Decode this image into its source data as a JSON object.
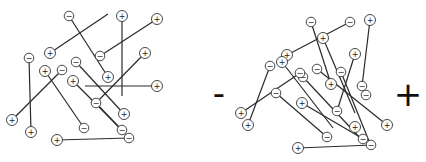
{
  "diagram": {
    "labels": {
      "negative_terminal": "-",
      "positive_terminal": "+"
    },
    "node_glyphs": {
      "positive": "+",
      "negative": "−"
    },
    "left_panel": {
      "edges": [
        {
          "from": [
            69,
            16
          ],
          "to": [
            108,
            77
          ]
        },
        {
          "from": [
            50,
            53
          ],
          "to": [
            108,
            14
          ]
        },
        {
          "from": [
            122,
            16
          ],
          "to": [
            122,
            96
          ]
        },
        {
          "from": [
            157,
            19
          ],
          "to": [
            100,
            56
          ]
        },
        {
          "from": [
            145,
            53
          ],
          "to": [
            96,
            103
          ]
        },
        {
          "from": [
            29,
            58
          ],
          "to": [
            31,
            132
          ]
        },
        {
          "from": [
            45,
            71
          ],
          "to": [
            84,
            128
          ]
        },
        {
          "from": [
            62,
            70
          ],
          "to": [
            12,
            120
          ]
        },
        {
          "from": [
            76,
            62
          ],
          "to": [
            124,
            114
          ]
        },
        {
          "from": [
            73,
            81
          ],
          "to": [
            122,
            130
          ]
        },
        {
          "from": [
            85,
            86
          ],
          "to": [
            157,
            86
          ]
        },
        {
          "from": [
            96,
            103
          ],
          "to": [
            129,
            138
          ]
        },
        {
          "from": [
            57,
            140
          ],
          "to": [
            129,
            138
          ]
        }
      ],
      "nodes": [
        {
          "x": 69,
          "y": 16,
          "sign": "-"
        },
        {
          "x": 122,
          "y": 16,
          "sign": "+"
        },
        {
          "x": 157,
          "y": 19,
          "sign": "+"
        },
        {
          "x": 50,
          "y": 53,
          "sign": "+"
        },
        {
          "x": 100,
          "y": 56,
          "sign": "-"
        },
        {
          "x": 145,
          "y": 53,
          "sign": "+"
        },
        {
          "x": 29,
          "y": 58,
          "sign": "-"
        },
        {
          "x": 76,
          "y": 62,
          "sign": "-"
        },
        {
          "x": 45,
          "y": 71,
          "sign": "+"
        },
        {
          "x": 62,
          "y": 70,
          "sign": "-"
        },
        {
          "x": 73,
          "y": 81,
          "sign": "+"
        },
        {
          "x": 108,
          "y": 77,
          "sign": "+"
        },
        {
          "x": 157,
          "y": 86,
          "sign": "+"
        },
        {
          "x": 96,
          "y": 103,
          "sign": "-"
        },
        {
          "x": 124,
          "y": 114,
          "sign": "+"
        },
        {
          "x": 12,
          "y": 120,
          "sign": "+"
        },
        {
          "x": 84,
          "y": 128,
          "sign": "-"
        },
        {
          "x": 122,
          "y": 130,
          "sign": "-"
        },
        {
          "x": 31,
          "y": 132,
          "sign": "+"
        },
        {
          "x": 129,
          "y": 138,
          "sign": "-"
        },
        {
          "x": 57,
          "y": 140,
          "sign": "+"
        }
      ]
    },
    "right_panel": {
      "edges": [
        {
          "from": [
            350,
            22
          ],
          "to": [
            287,
            55
          ]
        },
        {
          "from": [
            311,
            22
          ],
          "to": [
            331,
            84
          ]
        },
        {
          "from": [
            323,
            38
          ],
          "to": [
            355,
            113
          ]
        },
        {
          "from": [
            370,
            20
          ],
          "to": [
            362,
            86
          ]
        },
        {
          "from": [
            355,
            54
          ],
          "to": [
            337,
            111
          ]
        },
        {
          "from": [
            270,
            66
          ],
          "to": [
            248,
            125
          ]
        },
        {
          "from": [
            282,
            62
          ],
          "to": [
            333,
            128
          ]
        },
        {
          "from": [
            300,
            73
          ],
          "to": [
            241,
            113
          ]
        },
        {
          "from": [
            303,
            77
          ],
          "to": [
            362,
            140
          ]
        },
        {
          "from": [
            317,
            69
          ],
          "to": [
            387,
            125
          ]
        },
        {
          "from": [
            341,
            72
          ],
          "to": [
            371,
            146
          ]
        },
        {
          "from": [
            302,
            103
          ],
          "to": [
            365,
            140
          ]
        },
        {
          "from": [
            276,
            93
          ],
          "to": [
            327,
            137
          ]
        },
        {
          "from": [
            298,
            148
          ],
          "to": [
            372,
            145
          ]
        }
      ],
      "nodes": [
        {
          "x": 311,
          "y": 22,
          "sign": "-"
        },
        {
          "x": 350,
          "y": 22,
          "sign": "-"
        },
        {
          "x": 370,
          "y": 20,
          "sign": "+"
        },
        {
          "x": 323,
          "y": 38,
          "sign": "+"
        },
        {
          "x": 287,
          "y": 55,
          "sign": "+"
        },
        {
          "x": 355,
          "y": 54,
          "sign": "+"
        },
        {
          "x": 270,
          "y": 66,
          "sign": "-"
        },
        {
          "x": 303,
          "y": 77,
          "sign": "-"
        },
        {
          "x": 317,
          "y": 69,
          "sign": "-"
        },
        {
          "x": 300,
          "y": 73,
          "sign": "-"
        },
        {
          "x": 282,
          "y": 62,
          "sign": "+"
        },
        {
          "x": 341,
          "y": 72,
          "sign": "-"
        },
        {
          "x": 331,
          "y": 84,
          "sign": "+"
        },
        {
          "x": 362,
          "y": 86,
          "sign": "-"
        },
        {
          "x": 366,
          "y": 95,
          "sign": "-"
        },
        {
          "x": 276,
          "y": 93,
          "sign": "-"
        },
        {
          "x": 302,
          "y": 103,
          "sign": "+"
        },
        {
          "x": 337,
          "y": 111,
          "sign": "-"
        },
        {
          "x": 241,
          "y": 113,
          "sign": "+"
        },
        {
          "x": 248,
          "y": 125,
          "sign": "+"
        },
        {
          "x": 355,
          "y": 127,
          "sign": "+"
        },
        {
          "x": 387,
          "y": 125,
          "sign": "+"
        },
        {
          "x": 327,
          "y": 137,
          "sign": "-"
        },
        {
          "x": 363,
          "y": 139,
          "sign": "-"
        },
        {
          "x": 371,
          "y": 145,
          "sign": "-"
        },
        {
          "x": 298,
          "y": 148,
          "sign": "+"
        }
      ]
    }
  }
}
